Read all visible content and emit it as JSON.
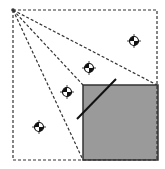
{
  "diagram": {
    "width": 165,
    "height": 169,
    "colors": {
      "background": "#ffffff",
      "dashed_line": "#333333",
      "obstacle_fill": "#9a9a9a",
      "obstacle_stroke": "#333333",
      "solid_line": "#111111",
      "marker_dark": "#111111",
      "marker_light": "#ffffff"
    },
    "outer_box": {
      "x1": 13,
      "y1": 10,
      "x2": 157,
      "y2": 160
    },
    "apex": {
      "x": 13,
      "y": 10
    },
    "rays": [
      {
        "to_x": 157,
        "to_y": 85
      },
      {
        "to_x": 83,
        "to_y": 85
      },
      {
        "to_x": 83,
        "to_y": 160
      }
    ],
    "obstacle": {
      "x": 83,
      "y": 85,
      "width": 75,
      "height": 75
    },
    "solid_segment": {
      "x1": 77,
      "y1": 119,
      "x2": 116,
      "y2": 79
    },
    "markers": [
      {
        "x": 39,
        "y": 127
      },
      {
        "x": 67,
        "y": 92
      },
      {
        "x": 89,
        "y": 68
      },
      {
        "x": 134,
        "y": 41
      }
    ]
  }
}
